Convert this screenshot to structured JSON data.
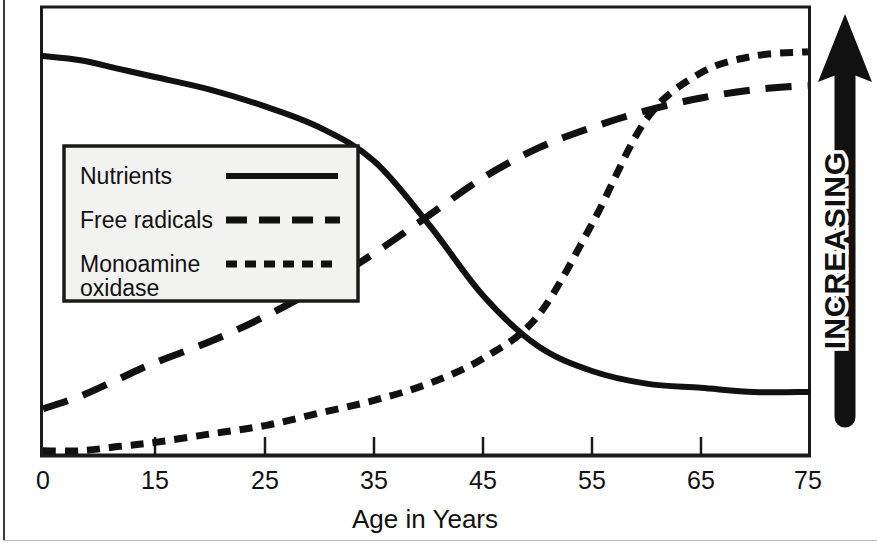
{
  "chart_data": {
    "type": "line",
    "title": "",
    "xlabel": "Age in Years",
    "ylabel": "INCREASING",
    "xticks": [
      "0",
      "15",
      "25",
      "35",
      "45",
      "55",
      "65",
      "75"
    ],
    "xtick_values": [
      0,
      15,
      25,
      35,
      45,
      55,
      65,
      75
    ],
    "xlim": [
      0,
      75
    ],
    "ylim": [
      0,
      100
    ],
    "yticks": [],
    "grid": false,
    "legend_position": "upper-left-inside",
    "series": [
      {
        "name": "Nutrients",
        "style": "solid",
        "x": [
          0,
          5,
          10,
          15,
          20,
          25,
          30,
          35,
          40,
          45,
          50,
          55,
          60,
          65,
          70,
          75
        ],
        "values": [
          95,
          94,
          92,
          90,
          87,
          83,
          78,
          70,
          55,
          38,
          26,
          20,
          17,
          16,
          15,
          15
        ]
      },
      {
        "name": "Free radicals",
        "style": "long-dash",
        "x": [
          0,
          5,
          10,
          15,
          20,
          25,
          30,
          35,
          40,
          45,
          50,
          55,
          60,
          65,
          70,
          75
        ],
        "values": [
          11,
          14,
          18,
          22,
          27,
          33,
          40,
          48,
          57,
          66,
          73,
          78,
          82,
          85,
          87,
          88
        ]
      },
      {
        "name": "Monoamine oxidase",
        "style": "short-dash",
        "x": [
          0,
          5,
          10,
          15,
          20,
          25,
          30,
          35,
          40,
          45,
          50,
          55,
          60,
          65,
          70,
          75
        ],
        "values": [
          1,
          1,
          2,
          3,
          5,
          7,
          10,
          13,
          17,
          23,
          33,
          55,
          80,
          91,
          95,
          96
        ]
      }
    ]
  },
  "legend": {
    "items": [
      {
        "label": "Nutrients",
        "style": "solid"
      },
      {
        "label": "Free radicals",
        "style": "long-dash"
      },
      {
        "label": "Monoamine",
        "label2": "oxidase",
        "style": "short-dash"
      }
    ]
  },
  "axis": {
    "x_title": "Age in Years",
    "tick_0": "0",
    "tick_15": "15",
    "tick_25": "25",
    "tick_35": "35",
    "tick_45": "45",
    "tick_55": "55",
    "tick_65": "65",
    "tick_75": "75"
  },
  "y_arrow": {
    "label": "INCREASING"
  },
  "colors": {
    "ink": "#111111",
    "frame": "#1a1a1a",
    "legend_fill": "#f2f2f0",
    "page_rule": "#3a3a3a"
  }
}
